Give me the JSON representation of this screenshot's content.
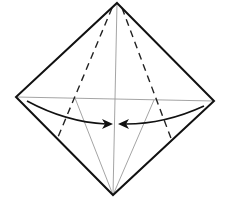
{
  "diagram": {
    "type": "origami-fold-step",
    "colors": {
      "edge": "#111111",
      "crease": "#9a9a9a",
      "valley": "#222222",
      "arrow": "#111111",
      "background": "#ffffff"
    },
    "vertices": {
      "top": [
        117,
        3
      ],
      "left": [
        16,
        97
      ],
      "right": [
        214,
        101
      ],
      "bottom": [
        113,
        195
      ]
    },
    "fold_instruction": "fold-left-and-right-corners-to-center"
  }
}
